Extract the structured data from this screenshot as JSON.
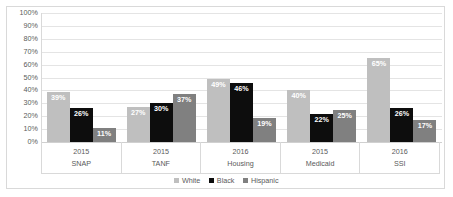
{
  "chart_data": {
    "type": "bar",
    "title": "",
    "subtitle": "",
    "xlabel": "",
    "ylabel": "",
    "ylim": [
      0,
      100
    ],
    "ytick_labels": [
      "100%",
      "90%",
      "80%",
      "70%",
      "60%",
      "50%",
      "40%",
      "30%",
      "20%",
      "10%",
      "0%"
    ],
    "ytick_values": [
      100,
      90,
      80,
      70,
      60,
      50,
      40,
      30,
      20,
      10,
      0
    ],
    "grid": true,
    "legend_position": "bottom",
    "categories": [
      "SNAP",
      "TANF",
      "Housing",
      "Medicaid",
      "SSI"
    ],
    "category_years": [
      "2015",
      "2015",
      "2016",
      "2015",
      "2016"
    ],
    "series": [
      {
        "name": "White",
        "color": "#bfbfbf",
        "values": [
          39,
          27,
          49,
          40,
          65
        ],
        "labels": [
          "39%",
          "27%",
          "49%",
          "40%",
          "65%"
        ]
      },
      {
        "name": "Black",
        "color": "#0d0d0d",
        "values": [
          26,
          30,
          46,
          22,
          26
        ],
        "labels": [
          "26%",
          "30%",
          "46%",
          "22%",
          "26%"
        ]
      },
      {
        "name": "Hispanic",
        "color": "#808080",
        "values": [
          11,
          37,
          19,
          25,
          17
        ],
        "labels": [
          "11%",
          "37%",
          "19%",
          "25%",
          "17%"
        ]
      }
    ]
  }
}
